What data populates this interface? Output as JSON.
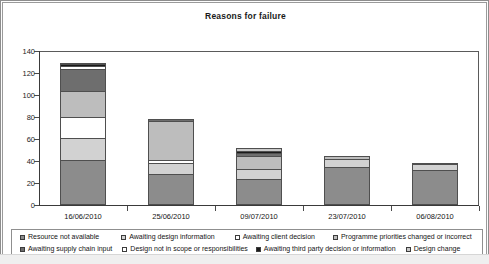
{
  "chart_data": {
    "type": "bar",
    "subtype": "stacked-bar",
    "title": "Reasons for failure",
    "xlabel": "",
    "ylabel": "",
    "ylim": [
      0,
      140
    ],
    "ytick_step": 20,
    "yticks": [
      0,
      20,
      40,
      60,
      80,
      100,
      120,
      140
    ],
    "ytick_labels": [
      "0",
      "20",
      "40",
      "60",
      "80",
      "100",
      "120",
      "140"
    ],
    "grid": false,
    "legend_position": "bottom",
    "categories": [
      "16/06/2010",
      "25/06/2010",
      "09/07/2010",
      "23/07/2010",
      "06/08/2010"
    ],
    "series": [
      {
        "name": "Resource not available",
        "color": "#8c8c8c",
        "values": [
          41,
          28,
          24,
          35,
          32
        ]
      },
      {
        "name": "Awaiting design information",
        "color": "#d2d2d2",
        "values": [
          20,
          10,
          9,
          7,
          5
        ]
      },
      {
        "name": "Awaiting client decision",
        "color": "#ffffff",
        "values": [
          19,
          3,
          0,
          0,
          0
        ]
      },
      {
        "name": "Programme priorities changed or incorrect",
        "color": "#bdbdbd",
        "values": [
          24,
          35,
          12,
          3,
          1
        ]
      },
      {
        "name": "Awaiting supply chain input",
        "color": "#6e6e6e",
        "values": [
          20,
          2,
          2,
          0,
          0
        ]
      },
      {
        "name": "Design not in scope or responsibilities",
        "color": "#ffffff",
        "values": [
          2,
          0,
          0,
          0,
          0
        ]
      },
      {
        "name": "Awaiting third party decision or information",
        "color": "#1a1a1a",
        "values": [
          2,
          0,
          2,
          0,
          0
        ]
      },
      {
        "name": "Design change",
        "color": "#c9c9c9",
        "values": [
          1,
          0,
          3,
          0,
          0
        ]
      }
    ],
    "totals": [
      129,
      78,
      52,
      45,
      38
    ]
  },
  "legend": {
    "row1": [
      {
        "label": "Resource not available",
        "color": "#8c8c8c"
      },
      {
        "label": "Awaiting design information",
        "color": "#d2d2d2"
      },
      {
        "label": "Awaiting client decision",
        "color": "#ffffff"
      },
      {
        "label": "Programme priorities changed or incorrect",
        "color": "#bdbdbd"
      }
    ],
    "row2": [
      {
        "label": "Awaiting supply chain input",
        "color": "#6e6e6e"
      },
      {
        "label": "Design not in scope or responsibilities",
        "color": "#ffffff"
      },
      {
        "label": "Awaiting third party decision or information",
        "color": "#1a1a1a"
      },
      {
        "label": "Design change",
        "color": "#c9c9c9"
      }
    ]
  }
}
